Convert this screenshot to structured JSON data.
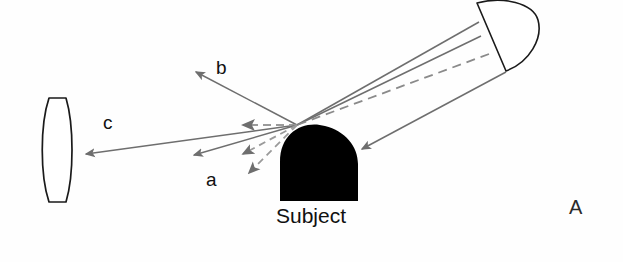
{
  "figure": {
    "panel_label": "A",
    "background_color": "#fefefe",
    "ray_color": "#6e6e6e",
    "outline_color": "#1a1a1a",
    "subject_fill": "#000000"
  },
  "labels": {
    "ray_a": "a",
    "ray_b": "b",
    "ray_c": "c",
    "subject": "Subject"
  },
  "objects": {
    "light_source": {
      "name": "light-source-reflector",
      "shape": "half-disc",
      "flat_edge": [
        [
          477,
          3
        ],
        [
          506,
          71
        ]
      ],
      "bulge_x": 539
    },
    "lens": {
      "name": "lens",
      "shape": "biconvex",
      "bounds": [
        43,
        97,
        71,
        203
      ]
    },
    "subject": {
      "name": "subject",
      "shape": "rounded-top-block",
      "bounds": [
        280,
        126,
        358,
        201
      ]
    }
  },
  "rays": [
    {
      "id": "source-to-subject-upper",
      "style": "solid",
      "from": [
        479,
        22
      ],
      "to": [
        297,
        125
      ],
      "arrow": "none"
    },
    {
      "id": "source-to-subject-mid",
      "style": "solid",
      "from": [
        481,
        36
      ],
      "to": [
        297,
        125
      ],
      "arrow": "none"
    },
    {
      "id": "source-to-subject-dashed",
      "style": "dashed",
      "from": [
        489,
        54
      ],
      "to": [
        297,
        125
      ],
      "arrow": "none"
    },
    {
      "id": "source-to-subject-right-side",
      "style": "solid",
      "from": [
        506,
        72
      ],
      "to": [
        358,
        150
      ],
      "arrow": "end"
    },
    {
      "id": "ray-b-reflected",
      "style": "solid",
      "from": [
        297,
        125
      ],
      "to": [
        192,
        70
      ],
      "arrow": "end"
    },
    {
      "id": "ray-c-to-lens",
      "style": "solid",
      "from": [
        297,
        125
      ],
      "to": [
        80,
        155
      ],
      "arrow": "end"
    },
    {
      "id": "ray-dashed-horizontal",
      "style": "dashed",
      "from": [
        297,
        125
      ],
      "to": [
        237,
        125
      ],
      "arrow": "end"
    },
    {
      "id": "ray-a-solid",
      "style": "solid",
      "from": [
        297,
        125
      ],
      "to": [
        188,
        157
      ],
      "arrow": "end"
    },
    {
      "id": "ray-a-dashed-1",
      "style": "dashed",
      "from": [
        297,
        125
      ],
      "to": [
        238,
        156
      ],
      "arrow": "end"
    },
    {
      "id": "ray-a-dashed-2",
      "style": "dashed",
      "from": [
        297,
        125
      ],
      "to": [
        244,
        176
      ],
      "arrow": "end"
    }
  ]
}
